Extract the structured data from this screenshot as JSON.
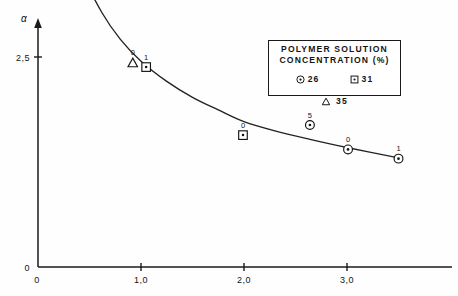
{
  "chart_data": {
    "type": "scatter",
    "title": "",
    "subtitle": "",
    "xlabel": "J(ℓ/hm²)",
    "ylabel": "α",
    "ylabel_secondary": "W/Et",
    "xlim": [
      0,
      3.75
    ],
    "ylim": [
      0,
      5.35
    ],
    "grid": false,
    "x_ticks": [
      {
        "value": 0,
        "label": "0"
      },
      {
        "value": 1.0,
        "label": "1,0"
      },
      {
        "value": 2.0,
        "label": "2,0"
      },
      {
        "value": 3.0,
        "label": "3,0"
      }
    ],
    "y_ticks": [
      {
        "value": 0,
        "label": "0"
      },
      {
        "value": 2.5,
        "label": "2,5"
      },
      {
        "value": 5.0,
        "label": "5,0"
      }
    ],
    "series": [
      {
        "name": "26",
        "marker": "circle-dot",
        "points": [
          {
            "x": 2.64,
            "y": 1.69,
            "label": "5"
          },
          {
            "x": 3.01,
            "y": 1.4,
            "label": "0"
          },
          {
            "x": 3.5,
            "y": 1.29,
            "label": "1"
          }
        ]
      },
      {
        "name": "31",
        "marker": "square-dot",
        "points": [
          {
            "x": 0.37,
            "y": 3.38,
            "label": "5"
          },
          {
            "x": 1.05,
            "y": 2.38,
            "label": "1"
          },
          {
            "x": 1.99,
            "y": 1.57,
            "label": "0"
          }
        ]
      },
      {
        "name": "35",
        "marker": "triangle",
        "points": [
          {
            "x": 0.16,
            "y": 4.76,
            "label": "5"
          },
          {
            "x": 0.43,
            "y": 3.55,
            "label": "1"
          },
          {
            "x": 0.92,
            "y": 2.43,
            "label": "0"
          }
        ]
      }
    ],
    "fit_curve": {
      "name": "fitted-decay-curve",
      "x": [
        0.16,
        0.3,
        0.45,
        0.62,
        0.8,
        1.0,
        1.25,
        1.5,
        1.75,
        2.0,
        2.3,
        2.64,
        3.01,
        3.5
      ],
      "y": [
        4.76,
        4.02,
        3.45,
        3.03,
        2.71,
        2.45,
        2.21,
        2.02,
        1.87,
        1.73,
        1.62,
        1.52,
        1.42,
        1.3
      ]
    }
  },
  "legend": {
    "title_line1": "POLYMER SOLUTION",
    "title_line2": "CONCENTRATION (%)",
    "entries": [
      {
        "symbol": "circle-dot",
        "label": "26"
      },
      {
        "symbol": "square-dot",
        "label": "31"
      },
      {
        "symbol": "triangle",
        "label": "35"
      }
    ]
  },
  "colors": {
    "ink": "#1a1a1a",
    "background": "#ffffff",
    "curve": "#222222"
  }
}
